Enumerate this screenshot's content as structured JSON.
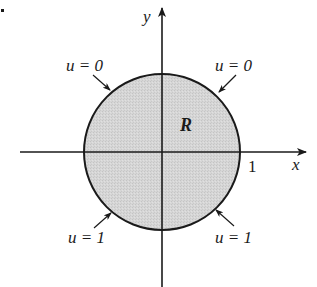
{
  "figure": {
    "type": "boundary-value-region",
    "region_label": "R",
    "axes": {
      "x_label": "x",
      "y_label": "y",
      "x_tick_label": "1"
    },
    "boundary_labels": {
      "top_left": "u = 0",
      "top_right": "u = 0",
      "bottom_left": "u = 1",
      "bottom_right": "u = 1"
    },
    "colors": {
      "region_fill": "#d4d4d4",
      "stroke": "#1a1a1a",
      "background": "#ffffff"
    }
  }
}
